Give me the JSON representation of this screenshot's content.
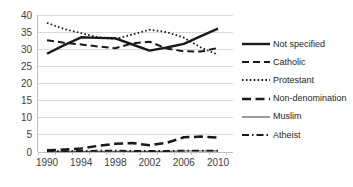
{
  "chart_data": {
    "type": "line",
    "title": "",
    "xlabel": "",
    "ylabel": "",
    "x": [
      1990,
      1992,
      1994,
      1996,
      1998,
      2000,
      2002,
      2004,
      2006,
      2008,
      2010
    ],
    "x_tick_labels": [
      "1990",
      "1994",
      "1998",
      "2002",
      "2006",
      "2010"
    ],
    "ylim": [
      0,
      40
    ],
    "y_ticks": [
      0,
      5,
      10,
      15,
      20,
      25,
      30,
      35,
      40
    ],
    "grid": "horizontal",
    "legend_position": "right",
    "series": [
      {
        "name": "Not specified",
        "slug": "not-specified",
        "style": "solid-bold",
        "color": "#1a1a1a",
        "values": [
          28.7,
          31.2,
          33.5,
          33.3,
          33.2,
          31.4,
          29.6,
          30.5,
          31.6,
          33.8,
          36.0
        ]
      },
      {
        "name": "Catholic",
        "slug": "catholic",
        "style": "dashed",
        "color": "#1a1a1a",
        "values": [
          32.6,
          31.9,
          31.4,
          30.8,
          30.3,
          31.7,
          32.2,
          30.2,
          29.4,
          29.3,
          30.4
        ]
      },
      {
        "name": "Protestant",
        "slug": "protestant",
        "style": "dotted",
        "color": "#1a1a1a",
        "values": [
          37.7,
          35.9,
          34.7,
          33.5,
          33.0,
          34.3,
          35.7,
          35.0,
          33.4,
          30.5,
          28.4
        ]
      },
      {
        "name": "Non-denomination",
        "slug": "non-denomination",
        "style": "long-dash",
        "color": "#1a1a1a",
        "values": [
          0.5,
          0.7,
          1.0,
          1.8,
          2.4,
          2.6,
          2.0,
          2.7,
          4.3,
          4.5,
          4.2
        ]
      },
      {
        "name": "Muslim",
        "slug": "muslim",
        "style": "solid-thin",
        "color": "#595959",
        "values": [
          0.1,
          0.1,
          0.2,
          0.2,
          0.2,
          0.2,
          0.2,
          0.2,
          0.3,
          0.3,
          0.3
        ]
      },
      {
        "name": "Atheist",
        "slug": "atheist",
        "style": "dash-dot",
        "color": "#1a1a1a",
        "values": [
          0.3,
          0.3,
          0.3,
          0.4,
          0.4,
          0.3,
          0.3,
          0.3,
          0.4,
          0.4,
          0.4
        ]
      }
    ],
    "colors": {
      "gridline": "#d9d9d9",
      "axis": "#bfbfbf",
      "tick_label": "#404040",
      "legend_text": "#262626"
    }
  }
}
